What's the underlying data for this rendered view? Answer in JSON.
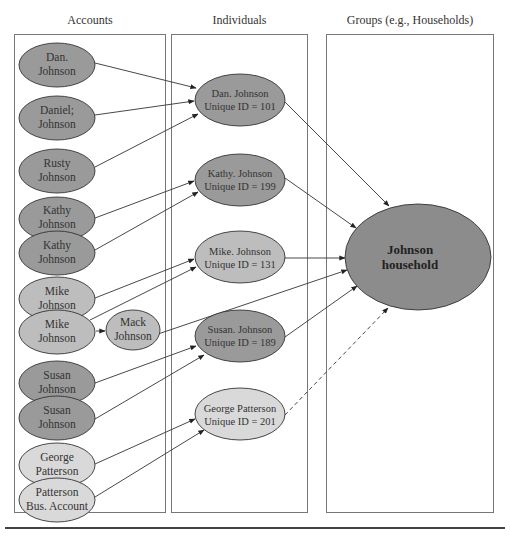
{
  "columns": {
    "accounts": "Accounts",
    "individuals": "Individuals",
    "groups": "Groups (e.g., Households)"
  },
  "colors": {
    "dark_fill": "#9a9a9a",
    "medium_fill": "#bdbdbd",
    "light_fill": "#d9d9d9",
    "household_fill": "#8c8c8c",
    "stroke": "#333333",
    "panel_border": "#777777"
  },
  "accounts": [
    {
      "id": "acc-dan",
      "line1": "Dan.",
      "line2": "Johnson",
      "shade": "dark"
    },
    {
      "id": "acc-daniel",
      "line1": "Daniel;",
      "line2": "Johnson",
      "shade": "dark"
    },
    {
      "id": "acc-rusty",
      "line1": "Rusty",
      "line2": "Johnson",
      "shade": "dark"
    },
    {
      "id": "acc-kathy-1",
      "line1": "Kathy",
      "line2": "Johnson",
      "shade": "dark"
    },
    {
      "id": "acc-kathy-2",
      "line1": "Kathy",
      "line2": "Johnson",
      "shade": "dark"
    },
    {
      "id": "acc-mike-1",
      "line1": "Mike",
      "line2": "Johnson",
      "shade": "medium"
    },
    {
      "id": "acc-mike-2",
      "line1": "Mike",
      "line2": "Johnson",
      "shade": "medium"
    },
    {
      "id": "acc-mack",
      "line1": "Mack",
      "line2": "Johnson",
      "shade": "medium"
    },
    {
      "id": "acc-susan-1",
      "line1": "Susan",
      "line2": "Johnson",
      "shade": "dark"
    },
    {
      "id": "acc-susan-2",
      "line1": "Susan",
      "line2": "Johnson",
      "shade": "dark"
    },
    {
      "id": "acc-george",
      "line1": "George",
      "line2": "Patterson",
      "shade": "light"
    },
    {
      "id": "acc-patterson-bus",
      "line1": "Patterson",
      "line2": "Bus. Account",
      "shade": "light"
    }
  ],
  "individuals": [
    {
      "id": "ind-dan",
      "line1": "Dan. Johnson",
      "line2": "Unique ID = 101",
      "shade": "dark"
    },
    {
      "id": "ind-kathy",
      "line1": "Kathy. Johnson",
      "line2": "Unique ID = 199",
      "shade": "dark"
    },
    {
      "id": "ind-mike",
      "line1": "Mike. Johnson",
      "line2": "Unique ID = 131",
      "shade": "medium"
    },
    {
      "id": "ind-susan",
      "line1": "Susan. Johnson",
      "line2": "Unique ID = 189",
      "shade": "dark"
    },
    {
      "id": "ind-george",
      "line1": "George Patterson",
      "line2": "Unique ID = 201",
      "shade": "light"
    }
  ],
  "groups": [
    {
      "id": "grp-johnson",
      "line1": "Johnson",
      "line2": "household",
      "shade": "household"
    }
  ],
  "edges": [
    {
      "from": "Dan. Johnson (account)",
      "to": "Dan. Johnson ID 101",
      "style": "solid"
    },
    {
      "from": "Daniel; Johnson",
      "to": "Dan. Johnson ID 101",
      "style": "solid"
    },
    {
      "from": "Rusty Johnson",
      "to": "Dan. Johnson ID 101",
      "style": "solid"
    },
    {
      "from": "Kathy Johnson (1)",
      "to": "Kathy. Johnson ID 199",
      "style": "solid"
    },
    {
      "from": "Kathy Johnson (2)",
      "to": "Kathy. Johnson ID 199",
      "style": "solid"
    },
    {
      "from": "Mike Johnson (1)",
      "to": "Mike. Johnson ID 131",
      "style": "solid"
    },
    {
      "from": "Mike Johnson (2)",
      "to": "Mike. Johnson ID 131",
      "style": "solid"
    },
    {
      "from": "Mike Johnson (2)",
      "to": "Mack Johnson",
      "style": "solid"
    },
    {
      "from": "Mack Johnson",
      "to": "Johnson household",
      "style": "solid"
    },
    {
      "from": "Susan Johnson (1)",
      "to": "Susan. Johnson ID 189",
      "style": "solid"
    },
    {
      "from": "Susan Johnson (2)",
      "to": "Susan. Johnson ID 189",
      "style": "solid"
    },
    {
      "from": "George Patterson (account)",
      "to": "George Patterson ID 201",
      "style": "solid"
    },
    {
      "from": "Patterson Bus. Account",
      "to": "George Patterson ID 201",
      "style": "solid"
    },
    {
      "from": "Dan. Johnson ID 101",
      "to": "Johnson household",
      "style": "solid"
    },
    {
      "from": "Kathy. Johnson ID 199",
      "to": "Johnson household",
      "style": "solid"
    },
    {
      "from": "Mike. Johnson ID 131",
      "to": "Johnson household",
      "style": "solid"
    },
    {
      "from": "Susan. Johnson ID 189",
      "to": "Johnson household",
      "style": "solid"
    },
    {
      "from": "George Patterson ID 201",
      "to": "Johnson household",
      "style": "dashed"
    }
  ]
}
